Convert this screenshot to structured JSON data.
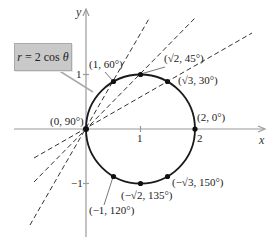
{
  "equation": {
    "r": "r",
    "rest": " = 2 cos ",
    "theta": "θ"
  },
  "axes": {
    "x_label": "x",
    "y_label": "y",
    "x_ticks": [
      "1",
      "2"
    ],
    "y_ticks": [
      "1",
      "−1"
    ]
  },
  "points": [
    {
      "label": "(0, 90°)"
    },
    {
      "label": "(1, 60°)"
    },
    {
      "label": "(√2, 45°)"
    },
    {
      "label": "(√3, 30°)"
    },
    {
      "label": "(2, 0°)"
    },
    {
      "label": "(−√3, 150°)"
    },
    {
      "label": "(−√2, 135°)"
    },
    {
      "label": "(−1, 120°)"
    }
  ],
  "colors": {
    "curve": "#1a1a1a",
    "axes": "#9a9a9a",
    "dashed": "#333333",
    "label_box": "#c9c9c9"
  }
}
